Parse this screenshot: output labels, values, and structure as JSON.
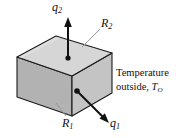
{
  "figure": {
    "background_color": "#ffffff",
    "width": 176,
    "height": 138
  },
  "solid": {
    "name": "rectangular-slab",
    "faces": {
      "top": {
        "name": "top-face",
        "color": "#d6d6d6",
        "label": "R_2 surface"
      },
      "front": {
        "name": "front-face",
        "color": "#c4c4c4",
        "label": "front"
      },
      "left": {
        "name": "left-face",
        "color": "#b2b2b2",
        "label": "R_1 surface"
      }
    },
    "edge_color": "#1a1a1a"
  },
  "labels": {
    "q2": {
      "text": "q",
      "sub": "2",
      "description": "heat flow out of top face"
    },
    "q1": {
      "text": "q",
      "sub": "1",
      "description": "heat flow out of front face"
    },
    "r2": {
      "text": "R",
      "sub": "2",
      "description": "thermal resistance of top surface"
    },
    "r1": {
      "text": "R",
      "sub": "1",
      "description": "thermal resistance of bottom surface"
    },
    "temperature": {
      "line1": "Temperature",
      "line2_prefix": "outside, ",
      "line2_var": "T",
      "line2_sub": "O"
    }
  },
  "arrows": {
    "q2_arrow": {
      "name": "q2-arrow",
      "from": [
        68,
        58
      ],
      "to": [
        68,
        22
      ],
      "color": "#111111",
      "has_base_dot": true
    },
    "q1_arrow": {
      "name": "q1-arrow",
      "from": [
        77,
        91
      ],
      "to": [
        107,
        121
      ],
      "color": "#111111",
      "has_base_dot": true
    }
  },
  "leaders": {
    "r2_leader": {
      "name": "r2-leader-line",
      "from": [
        100,
        29
      ],
      "to": [
        83,
        46
      ],
      "color": "#8c8c8c"
    },
    "r1_leader": {
      "name": "r1-leader-line",
      "from": [
        66,
        116
      ],
      "to": [
        56,
        103
      ],
      "color": "#8c8c8c"
    }
  }
}
